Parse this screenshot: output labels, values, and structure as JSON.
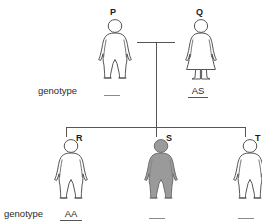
{
  "diagram": {
    "generation_labels": {
      "parents_genotype_label": "genotype",
      "children_genotype_label": "genotype"
    },
    "colors": {
      "outline": "#555555",
      "affected_fill": "#9a9a9a",
      "unaffected_fill": "#ffffff",
      "text": "#1a1a1a",
      "line": "#555555"
    },
    "individuals": [
      {
        "id": "P",
        "label": "P",
        "sex": "male",
        "affected": false,
        "genotype": "",
        "genotype_blank": true
      },
      {
        "id": "Q",
        "label": "Q",
        "sex": "female",
        "affected": false,
        "genotype": "AS",
        "genotype_blank": false
      },
      {
        "id": "R",
        "label": "R",
        "sex": "male",
        "affected": false,
        "genotype": "AA",
        "genotype_blank": false
      },
      {
        "id": "S",
        "label": "S",
        "sex": "male",
        "affected": true,
        "genotype": "",
        "genotype_blank": true
      },
      {
        "id": "T",
        "label": "T",
        "sex": "male",
        "affected": false,
        "genotype": "",
        "genotype_blank": true
      }
    ]
  }
}
